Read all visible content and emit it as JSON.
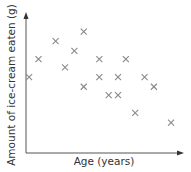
{
  "chart_data": {
    "type": "scatter",
    "title": "",
    "xlabel": "Age (years)",
    "ylabel": "Amount of ice-cream eaten (g)",
    "grid": false,
    "legend": null,
    "axis_ticks": "none",
    "marker": "x",
    "marker_color": "#8a8a8a",
    "axis_color": "#555555",
    "points_relative": [
      {
        "x": 0.02,
        "y": 0.55
      },
      {
        "x": 0.08,
        "y": 0.68
      },
      {
        "x": 0.19,
        "y": 0.81
      },
      {
        "x": 0.25,
        "y": 0.62
      },
      {
        "x": 0.31,
        "y": 0.74
      },
      {
        "x": 0.37,
        "y": 0.88
      },
      {
        "x": 0.37,
        "y": 0.48
      },
      {
        "x": 0.47,
        "y": 0.68
      },
      {
        "x": 0.47,
        "y": 0.55
      },
      {
        "x": 0.53,
        "y": 0.42
      },
      {
        "x": 0.59,
        "y": 0.55
      },
      {
        "x": 0.59,
        "y": 0.42
      },
      {
        "x": 0.64,
        "y": 0.68
      },
      {
        "x": 0.7,
        "y": 0.29
      },
      {
        "x": 0.76,
        "y": 0.55
      },
      {
        "x": 0.82,
        "y": 0.48
      },
      {
        "x": 0.93,
        "y": 0.22
      }
    ]
  }
}
